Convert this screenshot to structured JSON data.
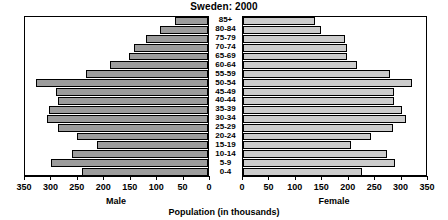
{
  "chart": {
    "title": "Sweden: 2000",
    "caption": "Population (in thousands)",
    "male_label": "Male",
    "female_label": "Female"
  },
  "chart_data": {
    "type": "bar",
    "subtype": "population-pyramid",
    "title": "Sweden: 2000",
    "xlabel": "Population (in thousands)",
    "ylabel": "",
    "xlim": [
      0,
      350
    ],
    "xticks": [
      0,
      50,
      100,
      150,
      200,
      250,
      300,
      350
    ],
    "grid": false,
    "legend": "none",
    "orientation": "horizontal",
    "categories": [
      "85+",
      "80-84",
      "75-79",
      "70-74",
      "65-69",
      "60-64",
      "55-59",
      "50-54",
      "45-49",
      "40-44",
      "35-39",
      "30-34",
      "25-29",
      "20-24",
      "15-19",
      "10-14",
      "5-9",
      "0-4"
    ],
    "series": [
      {
        "name": "Male",
        "direction": "left",
        "color": "#9c9c9c",
        "axis_label": "Male",
        "tick_labels": [
          "350",
          "300",
          "250",
          "200",
          "150",
          "100",
          "50",
          "0"
        ],
        "values": [
          62,
          90,
          118,
          140,
          150,
          185,
          230,
          325,
          287,
          283,
          300,
          305,
          283,
          248,
          210,
          258,
          298,
          238
        ]
      },
      {
        "name": "Female",
        "direction": "right",
        "color": "#cccccc",
        "axis_label": "Female",
        "tick_labels": [
          "0",
          "50",
          "100",
          "150",
          "200",
          "250",
          "300",
          "350"
        ],
        "values": [
          137,
          148,
          193,
          196,
          196,
          216,
          278,
          320,
          285,
          285,
          300,
          308,
          283,
          243,
          205,
          272,
          288,
          225
        ]
      }
    ]
  }
}
